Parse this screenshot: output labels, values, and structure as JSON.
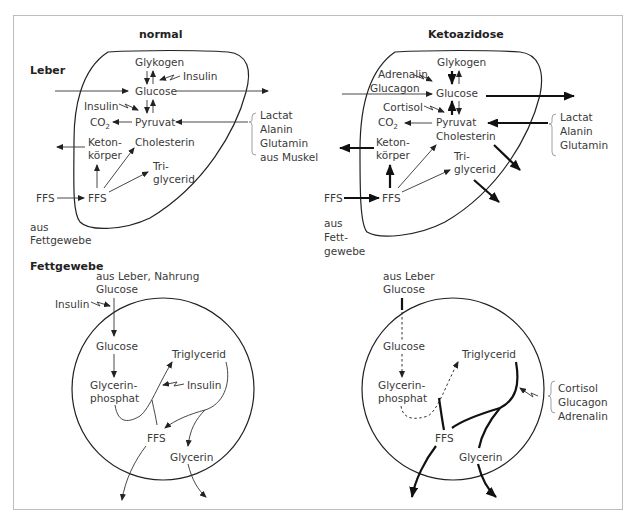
{
  "titles": {
    "normal": "normal",
    "ketoazidose": "Ketoazidose"
  },
  "sections": {
    "leber": "Leber",
    "fettgewebe": "Fettgewebe"
  },
  "normal_liver": {
    "glykogen": "Glykogen",
    "insulin_top": "Insulin",
    "glucose": "Glucose",
    "insulin_mid": "Insulin",
    "co2": "CO",
    "co2_sub": "2",
    "pyruvat": "Pyruvat",
    "keton": "Keton-",
    "koerper": "körper",
    "cholesterin": "Cholesterin",
    "tri": "Tri-",
    "glycerid": "glycerid",
    "ffs_in": "FFS",
    "ffs": "FFS",
    "aus": "aus",
    "fettgewebe": "Fettgewebe",
    "sources": [
      "Lactat",
      "Alanin",
      "Glutamin",
      "aus Muskel"
    ]
  },
  "keto_liver": {
    "glykogen": "Glykogen",
    "adrenalin": "Adrenalin",
    "glucagon": "Glucagon",
    "glucose": "Glucose",
    "cortisol": "Cortisol",
    "co2": "CO",
    "co2_sub": "2",
    "pyruvat": "Pyruvat",
    "cholesterin": "Cholesterin",
    "keton": "Keton-",
    "koerper": "körper",
    "tri": "Tri-",
    "glycerid": "glycerid",
    "ffs_in": "FFS",
    "ffs": "FFS",
    "aus": "aus",
    "fett": "Fett-",
    "gewebe": "gewebe",
    "sources": [
      "Lactat",
      "Alanin",
      "Glutamin"
    ]
  },
  "normal_fat": {
    "source": "aus Leber, Nahrung",
    "glucose_in": "Glucose",
    "insulin_top": "Insulin",
    "glucose": "Glucose",
    "glycerin": "Glycerin-",
    "phosphat": "phosphat",
    "triglycerid": "Triglycerid",
    "insulin": "Insulin",
    "ffs": "FFS",
    "glycerin_out": "Glycerin"
  },
  "keto_fat": {
    "source": "aus Leber",
    "glucose_in": "Glucose",
    "glucose": "Glucose",
    "glycerin": "Glycerin-",
    "phosphat": "phosphat",
    "triglycerid": "Triglycerid",
    "ffs": "FFS",
    "glycerin_out": "Glycerin",
    "hormones": [
      "Cortisol",
      "Glucagon",
      "Adrenalin"
    ]
  }
}
